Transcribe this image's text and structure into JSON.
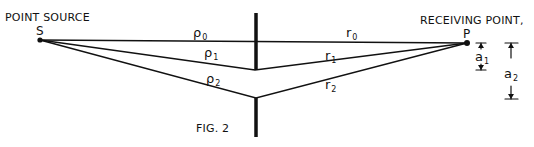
{
  "figure": {
    "caption": "FIG. 2",
    "source_label": "POINT SOURCE",
    "source_letter": "S",
    "receiver_label": "RECEIVING POINT,",
    "receiver_letter": "P",
    "ink_color": "#111111",
    "background": "#ffffff"
  },
  "paths": {
    "direct": {
      "left_label": "ρ",
      "left_sub": "0",
      "right_label": "r",
      "right_sub": "0"
    },
    "path1": {
      "left_label": "ρ",
      "left_sub": "1",
      "right_label": "r",
      "right_sub": "1"
    },
    "path2": {
      "left_label": "ρ",
      "left_sub": "2",
      "right_label": "r",
      "right_sub": "2"
    }
  },
  "dimensions": {
    "a1": {
      "label": "a",
      "sub": "1"
    },
    "a2": {
      "label": "a",
      "sub": "2"
    }
  }
}
